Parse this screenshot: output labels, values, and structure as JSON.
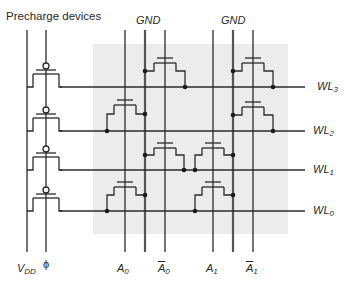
{
  "title": "Precharge devices",
  "gnd_labels": [
    "GND",
    "GND"
  ],
  "word_lines": [
    {
      "base": "WL",
      "sub": "3"
    },
    {
      "base": "WL",
      "sub": "2"
    },
    {
      "base": "WL",
      "sub": "1"
    },
    {
      "base": "WL",
      "sub": "0"
    }
  ],
  "bottom_labels": {
    "vdd": {
      "base": "V",
      "sub": "DD"
    },
    "phi": "ϕ",
    "a0": {
      "base": "A",
      "sub": "0"
    },
    "a0_bar": {
      "base": "A",
      "sub": "0"
    },
    "a1": {
      "base": "A",
      "sub": "1"
    },
    "a1_bar": {
      "base": "A",
      "sub": "1"
    }
  },
  "colors": {
    "line": "#2b2b2b",
    "gnd_line": "#555555",
    "array_bg": "#ececec"
  }
}
